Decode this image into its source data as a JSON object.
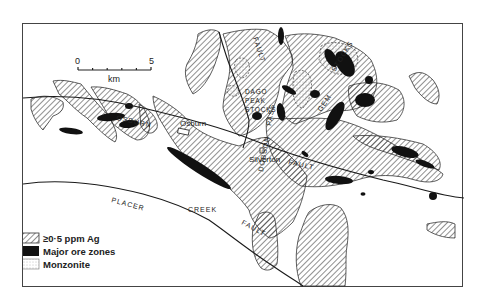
{
  "map": {
    "scale_bar": {
      "start_label": "0",
      "end_label": "5",
      "unit_label": "km",
      "ticks": 6
    },
    "fault_labels": {
      "osburn": "OSBURN",
      "osburn_fault": "FAULT",
      "placer": "PLACER",
      "creek": "CREEK",
      "placer_fault": "FAULT",
      "dobson": "DOBSON",
      "pass": "PASS",
      "dobson_fault": "FAULT"
    },
    "place_labels": {
      "osburn_town": "Osburn",
      "silverton_town": "Silverton"
    },
    "stock_labels": {
      "dago_line1": "DAGO",
      "dago_line2": "PEAK",
      "dago_line3": "STOCKS",
      "gem": "GEM",
      "stocks": "STOCKS"
    },
    "legend": {
      "items": [
        {
          "label": "≥0·5 ppm Ag",
          "pattern": "diagonal-hatch"
        },
        {
          "label": "Major ore zones",
          "pattern": "solid-black"
        },
        {
          "label": "Monzonite",
          "pattern": "stipple"
        }
      ]
    },
    "colors": {
      "ink": "#1a1a1a",
      "hatch": "#333333",
      "paper": "#ffffff",
      "frame": "#444444"
    }
  }
}
